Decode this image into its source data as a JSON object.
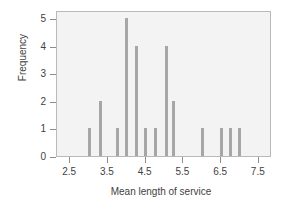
{
  "chart_data": {
    "type": "bar",
    "title": "",
    "subtitle": "",
    "xlabel": "Mean length of service",
    "ylabel": "Frequency",
    "xlim": [
      2.15,
      7.85
    ],
    "ylim": [
      0,
      5.3
    ],
    "grid": false,
    "legend": null,
    "xticks": [
      "2.5",
      "3.5",
      "4.5",
      "5.5",
      "6.5",
      "7.5"
    ],
    "xtick_values": [
      2.5,
      3.5,
      4.5,
      5.5,
      6.5,
      7.5
    ],
    "yticks": [
      "0",
      "1",
      "2",
      "3",
      "4",
      "5"
    ],
    "ytick_values": [
      0,
      1,
      2,
      3,
      4,
      5
    ],
    "bar_color": "#a6a6a6",
    "plot_background": "#f3f3f3",
    "frame_color": "#b9b9b9",
    "x": [
      3.0,
      3.3,
      3.75,
      4.0,
      4.25,
      4.5,
      4.75,
      5.05,
      5.25,
      6.0,
      6.5,
      6.75,
      7.0
    ],
    "values": [
      1,
      2,
      1,
      5,
      4,
      1,
      1,
      4,
      2,
      1,
      1,
      1,
      1
    ],
    "bars": [
      {
        "x": 3.0,
        "value": 1
      },
      {
        "x": 3.3,
        "value": 2
      },
      {
        "x": 3.75,
        "value": 1
      },
      {
        "x": 4.0,
        "value": 5
      },
      {
        "x": 4.25,
        "value": 4
      },
      {
        "x": 4.5,
        "value": 1
      },
      {
        "x": 4.75,
        "value": 1
      },
      {
        "x": 5.05,
        "value": 4
      },
      {
        "x": 5.25,
        "value": 2
      },
      {
        "x": 6.0,
        "value": 1
      },
      {
        "x": 6.5,
        "value": 1
      },
      {
        "x": 6.75,
        "value": 1
      },
      {
        "x": 7.0,
        "value": 1
      }
    ]
  }
}
